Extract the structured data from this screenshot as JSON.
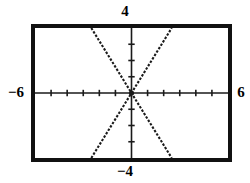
{
  "screen": {
    "name": "graphing-calculator-viewing-window",
    "background_color": "#ffffff",
    "frame_color": "#111111",
    "curve_color": "#1a1a1a"
  },
  "labels": {
    "ymax": "4",
    "ymin": "−4",
    "xmin": "−6",
    "xmax": "6"
  },
  "chart_data": {
    "type": "line",
    "title": "",
    "xlabel": "",
    "ylabel": "",
    "xlim": [
      -6,
      6
    ],
    "ylim": [
      -4,
      4
    ],
    "xscl": 1,
    "yscl": 1,
    "grid": false,
    "legend": false,
    "axes_style": "crosshair-with-tick-marks",
    "line_style": "dotted",
    "x_tick_values": [
      -5,
      -4,
      -3,
      -2,
      -1,
      1,
      2,
      3,
      4,
      5
    ],
    "y_tick_values": [
      -3,
      -2,
      -1,
      1,
      2,
      3
    ],
    "series": [
      {
        "name": "y = 1.6x",
        "slope": 1.6,
        "intercept": 0,
        "x": [
          -2.5,
          2.5
        ],
        "values": [
          -4,
          4
        ]
      },
      {
        "name": "y = -1.6x",
        "slope": -1.6,
        "intercept": 0,
        "x": [
          -2.5,
          2.5
        ],
        "values": [
          4,
          -4
        ]
      }
    ],
    "annotations": [
      {
        "text": "4",
        "position": "above-window-top"
      },
      {
        "text": "−4",
        "position": "below-window-bottom"
      },
      {
        "text": "−6",
        "position": "left-of-window"
      },
      {
        "text": "6",
        "position": "right-of-window"
      }
    ]
  }
}
